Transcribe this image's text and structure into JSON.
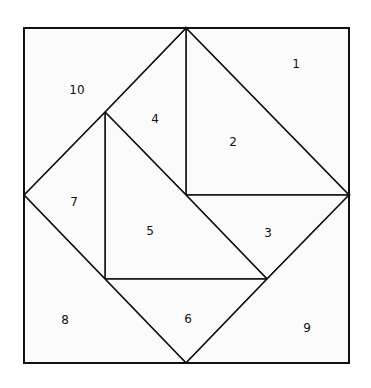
{
  "diagram": {
    "type": "tangram-square-dissection",
    "stroke": "#111111",
    "fill": "#fbfbfb",
    "pieces": [
      {
        "label": "1",
        "x": 296,
        "y": 64,
        "points": "186,28 349,28 349,195"
      },
      {
        "label": "2",
        "x": 233,
        "y": 142,
        "points": "186,28 349,195 186,195"
      },
      {
        "label": "3",
        "x": 268,
        "y": 233,
        "points": "186,195 349,195 267,279"
      },
      {
        "label": "4",
        "x": 155,
        "y": 119,
        "points": "186,28 186,195 105,112"
      },
      {
        "label": "5",
        "x": 150,
        "y": 231,
        "points": "105,112 186,195 267,279 105,279"
      },
      {
        "label": "6",
        "x": 188,
        "y": 319,
        "points": "105,279 267,279 186,363"
      },
      {
        "label": "7",
        "x": 74,
        "y": 202,
        "points": "105,112 105,279 24,195"
      },
      {
        "label": "8",
        "x": 65,
        "y": 320,
        "points": "24,195 186,363 24,363"
      },
      {
        "label": "9",
        "x": 307,
        "y": 328,
        "points": "349,195 349,363 186,363 267,279"
      },
      {
        "label": "10",
        "x": 77,
        "y": 90,
        "points": "24,28 186,28 105,112 24,195"
      }
    ]
  }
}
